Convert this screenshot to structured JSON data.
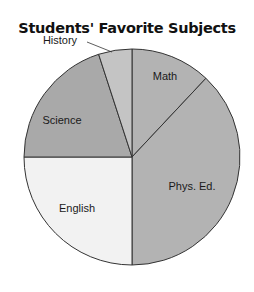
{
  "chart_data": {
    "type": "pie",
    "title": "Students' Favorite Subjects",
    "categories": [
      "Math",
      "Phys. Ed.",
      "English",
      "Science",
      "History"
    ],
    "values": [
      12,
      38,
      25,
      20,
      5
    ],
    "unit": "percent (estimated from slice angles)",
    "start_angle": "12 o'clock, clockwise",
    "colors": [
      "#b3b3b3",
      "#b3b3b3",
      "#f2f2f2",
      "#a9a9a9",
      "#c4c4c4"
    ],
    "labels_inside": [
      "Math",
      "Phys. Ed.",
      "English",
      "Science"
    ],
    "labels_outside": [
      "History"
    ],
    "legend": "none"
  }
}
